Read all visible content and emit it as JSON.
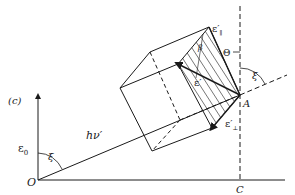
{
  "figure": {
    "panel_label": "(c)",
    "labels": {
      "origin": "O",
      "point_a": "A",
      "point_c": "C",
      "e0": "ε",
      "e0_sub": "0",
      "photon": "hν′",
      "xi_left": "ξ",
      "xi_right": "ξ",
      "theta": "Θ",
      "beta": "β",
      "e_prime": "ε′",
      "e_parallel": "ε′",
      "e_parallel_sub": "∥",
      "e_perp": "ε′",
      "e_perp_sub": "⊥"
    },
    "colors": {
      "ink": "#1a1a1a",
      "background": "#ffffff"
    }
  }
}
